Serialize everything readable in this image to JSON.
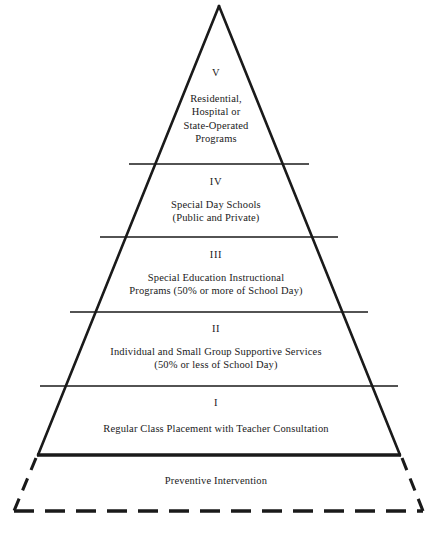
{
  "diagram": {
    "type": "pyramid",
    "shape_name": "cascade-of-services-pyramid",
    "orientation": "apex-up",
    "tier_count": 5,
    "has_dashed_foundation": true,
    "stroke_color": "#1a1a1a",
    "fill_color": "#ffffff",
    "background_color": "#ffffff",
    "tiers": [
      {
        "numeral": "V",
        "level": 5,
        "position": "top",
        "text": "Residential,\nHospital or\nState-Operated\nPrograms",
        "lines": [
          "Residential,",
          "Hospital or",
          "State-Operated",
          "Programs"
        ]
      },
      {
        "numeral": "IV",
        "level": 4,
        "position": "second",
        "text": "Special Day Schools\n(Public and Private)",
        "lines": [
          "Special Day Schools",
          "(Public and Private)"
        ]
      },
      {
        "numeral": "III",
        "level": 3,
        "position": "middle",
        "text": "Special Education Instructional\nPrograms (50% or more of School Day)",
        "lines": [
          "Special Education Instructional",
          "Programs (50% or more of School Day)"
        ]
      },
      {
        "numeral": "II",
        "level": 2,
        "position": "fourth",
        "text": "Individual and Small Group Supportive Services\n(50% or less of School Day)",
        "lines": [
          "Individual and Small Group Supportive Services",
          "(50% or less of School Day)"
        ]
      },
      {
        "numeral": "I",
        "level": 1,
        "position": "bottom",
        "text": "Regular Class Placement with Teacher Consultation",
        "lines": [
          "Regular Class Placement with Teacher Consultation"
        ]
      }
    ],
    "foundation": {
      "label": "Preventive Intervention",
      "border_style": "dashed"
    }
  }
}
